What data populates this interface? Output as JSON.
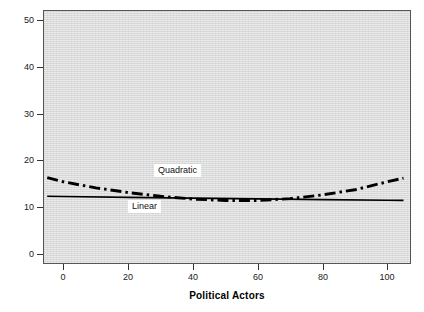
{
  "chart_data": {
    "type": "line",
    "title": "",
    "xlabel": "Political Actors",
    "ylabel": "Partisan and campaign activism",
    "xlim": [
      -6,
      107
    ],
    "ylim": [
      -2,
      52
    ],
    "xticks": [
      0,
      20,
      40,
      60,
      80,
      100
    ],
    "yticks": [
      0,
      10,
      20,
      30,
      40,
      50
    ],
    "xtick_labels": [
      "0",
      "20",
      "40",
      "60",
      "80",
      "100"
    ],
    "ytick_labels": [
      "0",
      "10",
      "20",
      "30",
      "40",
      "50"
    ],
    "grid": false,
    "legend_position": "inline-annotations",
    "plot_background": "#d9d9d9",
    "figure_background": "#ffffff",
    "series": [
      {
        "name": "Linear",
        "style": "solid",
        "color": "#000000",
        "linewidth": 1.6,
        "x": [
          -5,
          0,
          20,
          40,
          60,
          80,
          100,
          105
        ],
        "values": [
          12.3,
          12.25,
          12.05,
          11.9,
          11.75,
          11.6,
          11.45,
          11.4
        ]
      },
      {
        "name": "Quadratic",
        "style": "dash-dot",
        "color": "#000000",
        "linewidth": 2.8,
        "x": [
          -5,
          0,
          10,
          20,
          30,
          40,
          50,
          60,
          70,
          80,
          90,
          100,
          105
        ],
        "values": [
          16.3,
          15.4,
          14.1,
          13.1,
          12.3,
          11.7,
          11.4,
          11.4,
          11.8,
          12.6,
          13.7,
          15.4,
          16.2
        ]
      }
    ],
    "annotations": [
      {
        "text": "Quadratic",
        "x": 28,
        "y": 18.0
      },
      {
        "text": "Linear",
        "x": 20,
        "y": 10.2
      }
    ]
  },
  "axis": {
    "x_title": "Political Actors",
    "y_title": "Partisan and campaign activism"
  }
}
